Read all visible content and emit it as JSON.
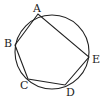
{
  "diagram": {
    "circle": {
      "cx": 52,
      "cy": 52,
      "r": 37
    },
    "points": [
      {
        "name": "A",
        "x": 38,
        "y": 14,
        "lx": 33,
        "ly": 12
      },
      {
        "name": "B",
        "x": 15,
        "y": 45,
        "lx": 4,
        "ly": 47
      },
      {
        "name": "C",
        "x": 28,
        "y": 79,
        "lx": 20,
        "ly": 89
      },
      {
        "name": "D",
        "x": 65,
        "y": 85,
        "lx": 66,
        "ly": 96
      },
      {
        "name": "E",
        "x": 89,
        "y": 57,
        "lx": 92,
        "ly": 63
      }
    ],
    "stroke_color": "#222222"
  }
}
